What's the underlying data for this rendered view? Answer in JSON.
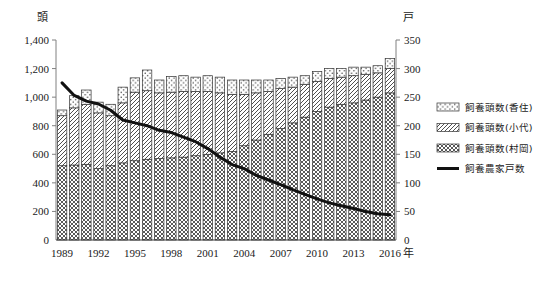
{
  "chart_data": {
    "type": "bar",
    "title": "",
    "subtitle": "",
    "stacked": true,
    "grid": false,
    "legend_position": "right",
    "xlabel": "年",
    "ylabel": "頭",
    "y2label": "戸",
    "ylim": [
      0,
      1400
    ],
    "y2lim": [
      0,
      350
    ],
    "ytick_labels": [
      "0",
      "200",
      "400",
      "600",
      "800",
      "1,000",
      "1,200",
      "1,400"
    ],
    "ytick_values": [
      0,
      200,
      400,
      600,
      800,
      1000,
      1200,
      1400
    ],
    "y2tick_labels": [
      "0",
      "50",
      "100",
      "150",
      "200",
      "250",
      "300",
      "350"
    ],
    "y2tick_values": [
      0,
      50,
      100,
      150,
      200,
      250,
      300,
      350
    ],
    "categories": [
      1989,
      1990,
      1991,
      1992,
      1993,
      1994,
      1995,
      1996,
      1997,
      1998,
      1999,
      2000,
      2001,
      2002,
      2003,
      2004,
      2005,
      2006,
      2007,
      2008,
      2009,
      2010,
      2011,
      2012,
      2013,
      2014,
      2015,
      2016
    ],
    "xtick_labels": [
      "1989",
      "1992",
      "1995",
      "1998",
      "2001",
      "2004",
      "2007",
      "2010",
      "2013",
      "2016"
    ],
    "xtick_values": [
      1989,
      1992,
      1995,
      1998,
      2001,
      2004,
      2007,
      2010,
      2013,
      2016
    ],
    "series": [
      {
        "name": "飼養頭数(村岡)",
        "axis": "left",
        "pattern": "crosshatch",
        "values": [
          520,
          525,
          530,
          500,
          520,
          540,
          555,
          565,
          570,
          575,
          580,
          590,
          600,
          610,
          620,
          660,
          700,
          740,
          780,
          820,
          860,
          900,
          930,
          950,
          960,
          980,
          1000,
          1030
        ]
      },
      {
        "name": "飼養頭数(小代)",
        "axis": "left",
        "pattern": "diagonal",
        "values": [
          350,
          400,
          420,
          390,
          350,
          420,
          480,
          480,
          460,
          460,
          460,
          450,
          440,
          420,
          400,
          360,
          330,
          300,
          280,
          250,
          230,
          210,
          200,
          190,
          190,
          180,
          170,
          170
        ]
      },
      {
        "name": "飼養頭数(香住)",
        "axis": "left",
        "pattern": "dots",
        "values": [
          40,
          85,
          100,
          75,
          80,
          110,
          100,
          145,
          90,
          110,
          110,
          100,
          110,
          110,
          100,
          100,
          90,
          80,
          70,
          70,
          60,
          70,
          70,
          60,
          60,
          50,
          50,
          70
        ]
      },
      {
        "name": "飼養農家戸数",
        "axis": "right",
        "pattern": "line",
        "values": [
          275,
          253,
          243,
          238,
          227,
          210,
          205,
          200,
          192,
          188,
          180,
          172,
          160,
          145,
          132,
          125,
          113,
          105,
          97,
          88,
          80,
          72,
          65,
          60,
          55,
          50,
          46,
          44
        ]
      }
    ],
    "totals": [
      910,
      1010,
      1050,
      965,
      950,
      1070,
      1135,
      1190,
      1120,
      1145,
      1150,
      1140,
      1150,
      1140,
      1120,
      1120,
      1120,
      1120,
      1130,
      1140,
      1150,
      1180,
      1200,
      1200,
      1210,
      1210,
      1220,
      1270
    ]
  },
  "legend": {
    "items": [
      {
        "label": "飼養頭数(香住)",
        "pattern": "dots"
      },
      {
        "label": "飼養頭数(小代)",
        "pattern": "diagonal"
      },
      {
        "label": "飼養頭数(村岡)",
        "pattern": "crosshatch"
      },
      {
        "label": "飼養農家戸数",
        "pattern": "line"
      }
    ]
  }
}
